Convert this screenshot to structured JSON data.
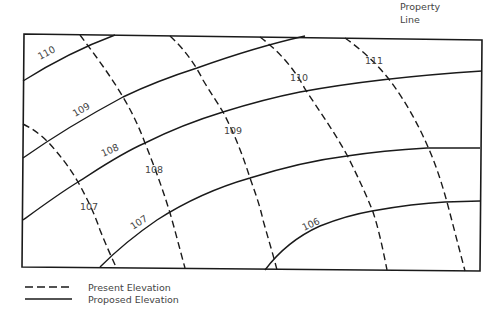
{
  "title_label": {
    "line1": "Property",
    "line2": "Line"
  },
  "legend": {
    "present": "Present Elevation",
    "proposed": "Proposed Elevation"
  },
  "contours": {
    "proposed": [
      {
        "value": "110"
      },
      {
        "value": "109"
      },
      {
        "value": "108"
      },
      {
        "value": "107"
      },
      {
        "value": "106"
      }
    ],
    "present": [
      {
        "value": "107"
      },
      {
        "value": "108"
      },
      {
        "value": "109"
      },
      {
        "value": "110"
      },
      {
        "value": "111"
      }
    ]
  },
  "colors": {
    "line": "#1a1a1a",
    "text": "#444444",
    "background": "#ffffff"
  }
}
